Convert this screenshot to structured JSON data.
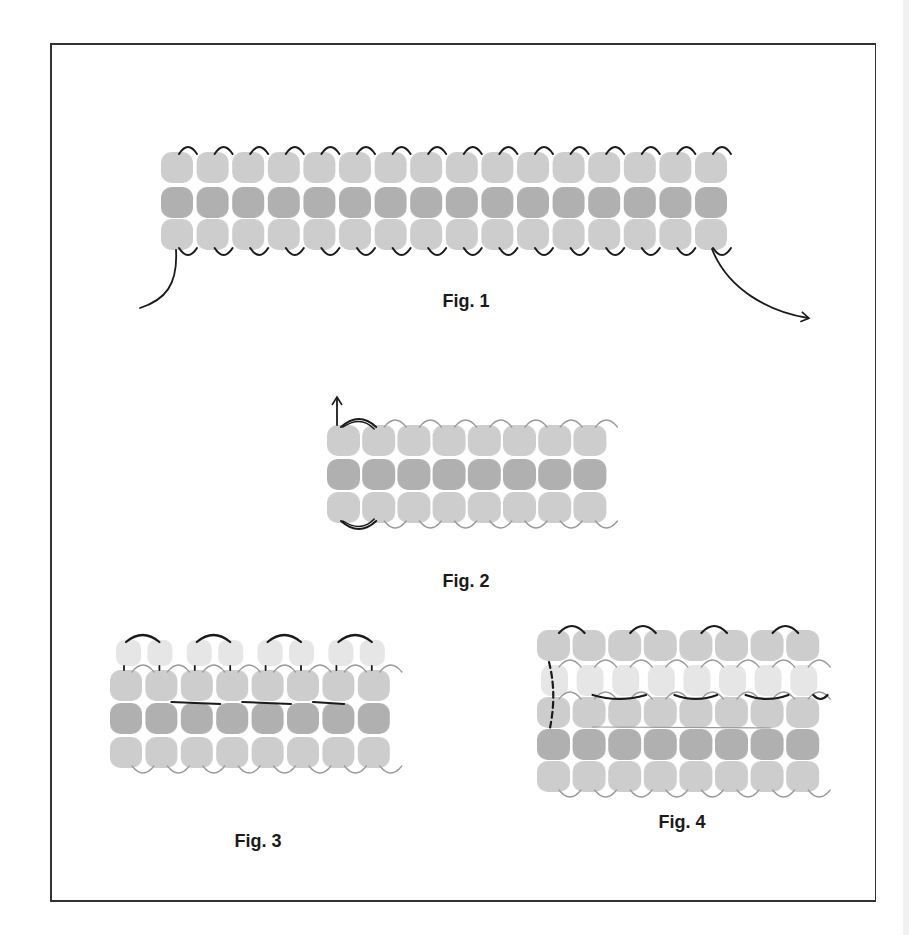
{
  "figures": [
    {
      "id": "fig1",
      "label": "Fig. 1",
      "label_pos": [
        466,
        302
      ],
      "columns": 16,
      "rows": [
        {
          "tone": "light",
          "y": 152
        },
        {
          "tone": "dark",
          "y": 187
        },
        {
          "tone": "light",
          "y": 219
        }
      ],
      "origin_x": 161,
      "pitch_x": 35.6,
      "bead_w": 32,
      "bead_h": 31,
      "thread_style": "solid-black",
      "arrows": [
        {
          "name": "thread-in-left",
          "path": "M176 250 C178 285 165 300 140 308",
          "arrowhead": false
        },
        {
          "name": "thread-out-right",
          "path": "M712 249 C728 290 770 312 808 318",
          "arrowhead": true
        }
      ]
    },
    {
      "id": "fig2",
      "label": "Fig. 2",
      "label_pos": [
        466,
        582
      ],
      "columns": 8,
      "rows": [
        {
          "tone": "light",
          "y": 425
        },
        {
          "tone": "dark",
          "y": 459
        },
        {
          "tone": "light",
          "y": 492
        }
      ],
      "origin_x": 327,
      "pitch_x": 35.2,
      "bead_w": 33,
      "bead_h": 31,
      "thread_style": "thin-gray",
      "arrows": [
        {
          "name": "thread-up-arrow",
          "path": "M337 425 L337 398",
          "arrowhead": true
        }
      ]
    },
    {
      "id": "fig3",
      "label": "Fig. 3",
      "label_pos": [
        258,
        842
      ],
      "columns": 8,
      "top_pairs": {
        "y": 640,
        "count": 8,
        "tone": "pale",
        "bead_w": 25,
        "bead_h": 26
      },
      "rows": [
        {
          "tone": "light",
          "y": 670
        },
        {
          "tone": "dark",
          "y": 703
        },
        {
          "tone": "light",
          "y": 737
        }
      ],
      "origin_x": 110,
      "pitch_x": 35.4,
      "bead_w": 32,
      "bead_h": 31,
      "thread_style": "mixed"
    },
    {
      "id": "fig4",
      "label": "Fig. 4",
      "label_pos": [
        682,
        823
      ],
      "columns": 8,
      "rows": [
        {
          "tone": "light",
          "y": 630
        },
        {
          "tone": "pale",
          "y": 665
        },
        {
          "tone": "light",
          "y": 697
        },
        {
          "tone": "dark",
          "y": 729
        },
        {
          "tone": "light",
          "y": 761
        }
      ],
      "origin_x": 537,
      "pitch_x": 35.6,
      "bead_w": 33,
      "bead_h": 31,
      "thread_style": "mixed",
      "dashed_path": "M549 662 C556 690 553 712 550 728"
    }
  ],
  "colors": {
    "light": "#cdcdcd",
    "dark": "#b0b0b0",
    "pale": "#e6e6e6",
    "thread_black": "#1a1a1a",
    "thread_gray": "#9a9a9a",
    "border": "#333333"
  }
}
